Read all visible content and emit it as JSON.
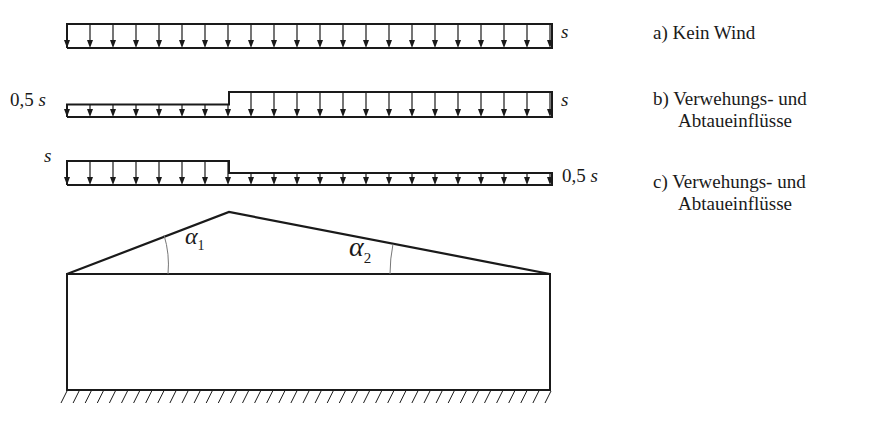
{
  "diagram": {
    "load_cases": [
      {
        "id": "a",
        "left_label": "",
        "right_label": "s",
        "description": "a) Kein Wind",
        "left_intensity": 1.0,
        "right_intensity": 1.0
      },
      {
        "id": "b",
        "left_label": "0,5 s",
        "right_label": "s",
        "description_line1": "b) Verwehungs- und",
        "description_line2": "Abtaueinflüsse",
        "left_intensity": 0.5,
        "right_intensity": 1.0
      },
      {
        "id": "c",
        "left_label": "s",
        "right_label": "0,5 s",
        "description_line1": "c) Verwehungs- und",
        "description_line2": "Abtaueinflüsse",
        "left_intensity": 1.0,
        "right_intensity": 0.5
      }
    ],
    "roof": {
      "angle_left_label": "α",
      "angle_left_sub": "1",
      "angle_right_label": "α",
      "angle_right_sub": "2"
    },
    "colors": {
      "line": "#1a1a1a",
      "arc": "#777777",
      "background": "#ffffff"
    }
  }
}
